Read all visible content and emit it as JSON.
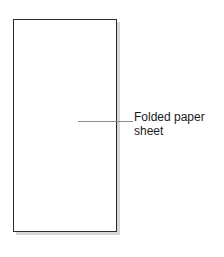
{
  "canvas": {
    "background_color": "#ffffff",
    "width": 224,
    "height": 257
  },
  "diagram": {
    "type": "technical-illustration",
    "shapes": [
      {
        "name": "folded-paper-sheet",
        "shape": "rectangle",
        "border_color": "#2b2b2b",
        "fill_color": "#ffffff",
        "shadow_color": "#d6d6d6"
      }
    ],
    "leader_line": {
      "color": "#8c8c8c",
      "orientation": "horizontal"
    },
    "callout": {
      "text": "Folded paper\nsheet",
      "line_1": "Folded paper",
      "line_2": "sheet",
      "text_color": "#1a1a1a"
    }
  }
}
